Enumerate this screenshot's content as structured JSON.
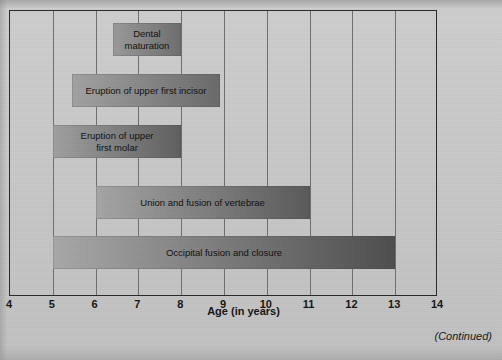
{
  "figure": {
    "continued_note": "(Continued)"
  },
  "chart_data": {
    "type": "bar",
    "orientation": "horizontal",
    "title": "",
    "xlabel": "Age (in years)",
    "ylabel": "",
    "xlim": [
      4,
      14
    ],
    "xticks": [
      4,
      5,
      6,
      7,
      8,
      9,
      10,
      11,
      12,
      13,
      14
    ],
    "xtick_labels": [
      "4",
      "5",
      "6",
      "7",
      "8",
      "9",
      "10",
      "11",
      "12",
      "13",
      "14"
    ],
    "grid": "vertical gridlines at every integer year",
    "legend": "none",
    "bar_fill": "horizontal gradient light-gray to dark-gray",
    "bars": [
      {
        "label": "Dental maturation",
        "label_lines": [
          "Dental",
          "maturation"
        ],
        "start": 6.4,
        "end": 8.0,
        "row": 0,
        "color_start": "#9a9a9a",
        "color_end": "#6e6e6e"
      },
      {
        "label": "Eruption of upper first incisor",
        "label_lines": [
          "Eruption of upper first incisor"
        ],
        "start": 5.45,
        "end": 8.9,
        "row": 1,
        "color_start": "#a2a2a2",
        "color_end": "#6a6a6a"
      },
      {
        "label": "Eruption of upper first molar",
        "label_lines": [
          "Eruption of upper",
          "first molar"
        ],
        "start": 5.0,
        "end": 8.0,
        "row": 2,
        "color_start": "#a0a0a0",
        "color_end": "#5f5f5f"
      },
      {
        "label": "Union and fusion of vertebrae",
        "label_lines": [
          "Union and fusion of vertebrae"
        ],
        "start": 6.0,
        "end": 11.0,
        "row": 3,
        "color_start": "#a5a5a5",
        "color_end": "#5a5a5a"
      },
      {
        "label": "Occipital fusion and closure",
        "label_lines": [
          "Occipital fusion and closure"
        ],
        "start": 5.0,
        "end": 13.0,
        "row": 4,
        "color_start": "#a8a8a8",
        "color_end": "#4e4e4e"
      }
    ]
  }
}
